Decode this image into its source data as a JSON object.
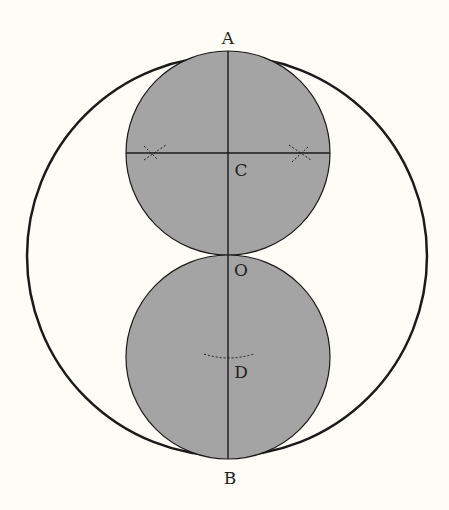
{
  "diagram": {
    "title": "",
    "colors": {
      "background": "#fdfcf6",
      "fill": "#a4a4a4",
      "stroke": "#1a1a1a"
    },
    "outer_circle": {
      "cx": 227,
      "cy": 256,
      "r": 200
    },
    "upper_circle": {
      "cx": 228,
      "cy": 153,
      "r": 102,
      "center_label": "C"
    },
    "lower_circle": {
      "cx": 228,
      "cy": 357,
      "r": 102,
      "center_label": "D"
    },
    "labels": {
      "A": "A",
      "B": "B",
      "C": "C",
      "O": "O",
      "D": "D"
    }
  }
}
